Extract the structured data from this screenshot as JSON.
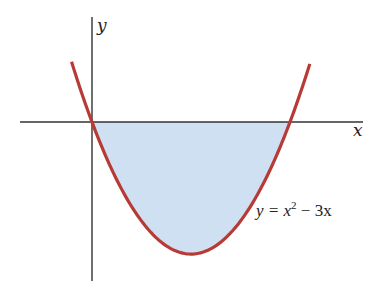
{
  "figure": {
    "x_axis_label": "x",
    "y_axis_label": "y",
    "equation": {
      "prefix": "y = ",
      "var": "x",
      "exp": "2",
      "suffix": " − 3x"
    },
    "colors": {
      "curve": "#b83a36",
      "fill": "#cfe0f3",
      "axis": "#333333"
    }
  },
  "chart_data": {
    "type": "line",
    "title": "",
    "function": "y = x^2 - 3x",
    "xlabel": "x",
    "ylabel": "y",
    "x": [
      -0.3,
      0,
      0.5,
      1,
      1.5,
      2,
      2.5,
      3,
      3.3
    ],
    "values": [
      0.99,
      0,
      -1.25,
      -2,
      -2.25,
      -2,
      -1.25,
      0,
      0.99
    ],
    "shaded_region": {
      "from_x": 0,
      "to_x": 3,
      "between": "curve and x-axis"
    },
    "roots": [
      0,
      3
    ],
    "vertex": [
      1.5,
      -2.25
    ],
    "grid": false,
    "ticks": false
  }
}
